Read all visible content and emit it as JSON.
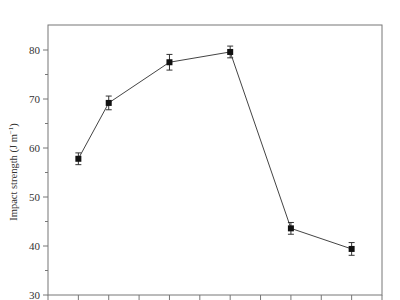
{
  "chart_data": {
    "type": "line",
    "title": "",
    "xlabel": "",
    "ylabel": "Impact strength (J m⁻¹)",
    "ylabel_parts": {
      "main": "Impact strength (J m",
      "sup": "−1",
      "close": ")"
    },
    "ylim": [
      30,
      85
    ],
    "yticks_major": [
      30,
      40,
      50,
      60,
      70,
      80
    ],
    "yticks_minor": [
      35,
      45,
      55,
      65,
      75
    ],
    "x_tick_count": 12,
    "x_tick_labels": [],
    "grid": false,
    "legend": null,
    "series": [
      {
        "name": "Impact strength",
        "marker": "square",
        "color": "#111111",
        "x_index": [
          1,
          2,
          4,
          6,
          8,
          10
        ],
        "values": [
          57.8,
          69.2,
          77.5,
          79.6,
          43.6,
          39.4
        ],
        "error": [
          1.2,
          1.4,
          1.6,
          1.2,
          1.2,
          1.3
        ]
      }
    ]
  }
}
